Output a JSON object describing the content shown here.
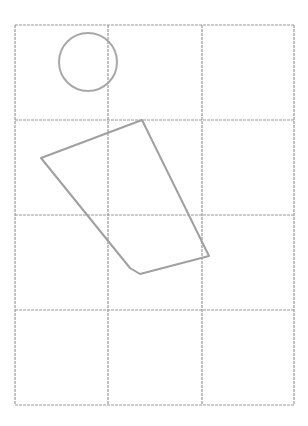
{
  "canvas": {
    "width": 308,
    "height": 426,
    "background": "#ffffff"
  },
  "grid": {
    "color": "#9a9a9a",
    "x": [
      15,
      108,
      202,
      294
    ],
    "y": [
      25,
      120,
      215,
      310,
      405
    ],
    "columns": 3,
    "rows": 4
  },
  "shapes": {
    "circle": {
      "cx": 88,
      "cy": 62,
      "r": 29,
      "stroke": "#a8a8a8"
    },
    "quadrilateral": {
      "points": "142,120 41,158 130,268 140,274 209,256",
      "stroke": "#a0a0a0"
    }
  }
}
